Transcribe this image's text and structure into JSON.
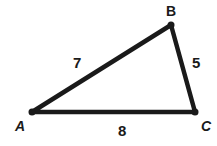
{
  "diagram": {
    "type": "triangle",
    "vertices": [
      {
        "name": "A",
        "x": 32,
        "y": 112
      },
      {
        "name": "B",
        "x": 171,
        "y": 25
      },
      {
        "name": "C",
        "x": 195,
        "y": 112
      }
    ],
    "sides": [
      {
        "from": "A",
        "to": "B",
        "length": "7"
      },
      {
        "from": "B",
        "to": "C",
        "length": "5"
      },
      {
        "from": "A",
        "to": "C",
        "length": "8"
      }
    ],
    "labels": {
      "A": "A",
      "B": "B",
      "C": "C",
      "AB": "7",
      "BC": "5",
      "AC": "8"
    },
    "stroke_color": "#1a1a1a"
  }
}
